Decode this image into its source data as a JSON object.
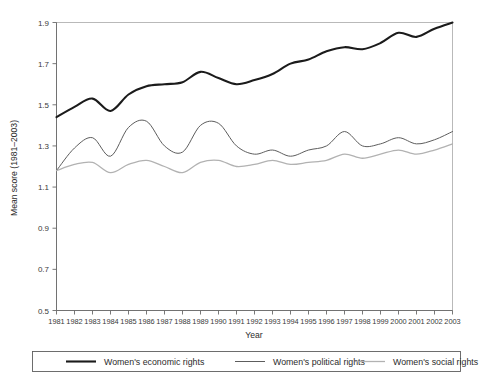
{
  "chart_data": {
    "type": "line",
    "title": "",
    "xlabel": "Year",
    "ylabel": "Mean score (1981–2003)",
    "xlim": [
      1981,
      2003
    ],
    "ylim": [
      0.5,
      1.9
    ],
    "yticks": [
      "0.5",
      "0.7",
      "0.9",
      "1.1",
      "1.3",
      "1.5",
      "1.7",
      "1.9"
    ],
    "ytick_values": [
      0.5,
      0.7,
      0.9,
      1.1,
      1.3,
      1.5,
      1.7,
      1.9
    ],
    "grid": false,
    "legend_position": "below-plot",
    "categories": [
      1981,
      1982,
      1983,
      1984,
      1985,
      1986,
      1987,
      1988,
      1989,
      1990,
      1991,
      1992,
      1993,
      1994,
      1995,
      1996,
      1997,
      1998,
      1999,
      2000,
      2001,
      2002,
      2003
    ],
    "xtick_labels": [
      "1981",
      "1982",
      "1983",
      "1984",
      "1985",
      "1986",
      "1987",
      "1988",
      "1989",
      "1990",
      "1991",
      "1992",
      "1993",
      "1994",
      "1995",
      "1996",
      "1997",
      "1998",
      "1999",
      "2000",
      "2001",
      "2002",
      "2003"
    ],
    "series": [
      {
        "name": "Women's economic rights",
        "color": "#1b1b1b",
        "width": 2.1,
        "values": [
          1.44,
          1.49,
          1.53,
          1.47,
          1.55,
          1.59,
          1.6,
          1.61,
          1.66,
          1.63,
          1.6,
          1.62,
          1.65,
          1.7,
          1.72,
          1.76,
          1.78,
          1.77,
          1.8,
          1.85,
          1.83,
          1.87,
          1.9
        ]
      },
      {
        "name": "Women's political rights",
        "color": "#5d5d5d",
        "width": 1.0,
        "values": [
          1.18,
          1.29,
          1.34,
          1.25,
          1.39,
          1.42,
          1.3,
          1.27,
          1.4,
          1.41,
          1.3,
          1.26,
          1.28,
          1.25,
          1.28,
          1.3,
          1.37,
          1.3,
          1.31,
          1.34,
          1.31,
          1.33,
          1.37
        ]
      },
      {
        "name": "Women's social rights",
        "color": "#b2b2b2",
        "width": 1.3,
        "values": [
          1.18,
          1.21,
          1.22,
          1.17,
          1.21,
          1.23,
          1.2,
          1.17,
          1.22,
          1.23,
          1.2,
          1.21,
          1.23,
          1.21,
          1.22,
          1.23,
          1.26,
          1.24,
          1.26,
          1.28,
          1.26,
          1.28,
          1.31
        ]
      }
    ]
  },
  "legend": {
    "items": [
      {
        "label": "Women's economic rights"
      },
      {
        "label": "Women's political rights"
      },
      {
        "label": "Women's social rights"
      }
    ]
  },
  "axes": {
    "x_title": "Year",
    "y_title": "Mean score (1981–2003)"
  }
}
